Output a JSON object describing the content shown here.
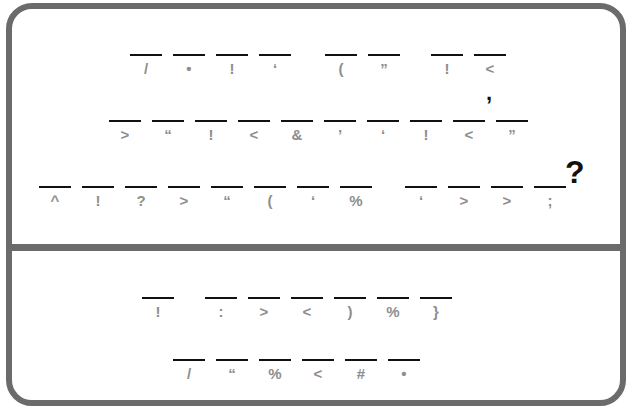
{
  "puzzle": {
    "type": "cryptogram",
    "question_section": {
      "rows": [
        {
          "line_y": 54,
          "slots": [
            {
              "x": 130,
              "symbol": "/"
            },
            {
              "x": 173,
              "symbol": "•"
            },
            {
              "x": 216,
              "symbol": "!"
            },
            {
              "x": 259,
              "symbol": "‘"
            },
            {
              "x": 325,
              "symbol": "("
            },
            {
              "x": 368,
              "symbol": "”"
            },
            {
              "x": 431,
              "symbol": "!"
            },
            {
              "x": 474,
              "symbol": "<"
            }
          ]
        },
        {
          "line_y": 120,
          "slots": [
            {
              "x": 109,
              "symbol": ">"
            },
            {
              "x": 152,
              "symbol": "“"
            },
            {
              "x": 195,
              "symbol": "!"
            },
            {
              "x": 238,
              "symbol": "<"
            },
            {
              "x": 281,
              "symbol": "&"
            },
            {
              "x": 324,
              "symbol": "’"
            },
            {
              "x": 367,
              "symbol": "‘"
            },
            {
              "x": 410,
              "symbol": "!"
            },
            {
              "x": 453,
              "symbol": "<"
            },
            {
              "x": 496,
              "symbol": "”"
            }
          ],
          "punctuation": [
            {
              "char": ",",
              "x": 486,
              "y": 80
            }
          ]
        },
        {
          "line_y": 186,
          "slots": [
            {
              "x": 39,
              "symbol": "^"
            },
            {
              "x": 82,
              "symbol": "!"
            },
            {
              "x": 125,
              "symbol": "?"
            },
            {
              "x": 168,
              "symbol": ">"
            },
            {
              "x": 211,
              "symbol": "“"
            },
            {
              "x": 254,
              "symbol": "("
            },
            {
              "x": 297,
              "symbol": "‘"
            },
            {
              "x": 340,
              "symbol": "%"
            },
            {
              "x": 405,
              "symbol": "‘"
            },
            {
              "x": 448,
              "symbol": ">"
            },
            {
              "x": 491,
              "symbol": ">"
            },
            {
              "x": 534,
              "symbol": ";"
            }
          ],
          "punctuation": [
            {
              "char": "?",
              "x": 565,
              "y": 156
            }
          ]
        }
      ]
    },
    "answer_section": {
      "rows": [
        {
          "line_y": 297,
          "slots": [
            {
              "x": 142,
              "symbol": "!"
            },
            {
              "x": 205,
              "symbol": ":"
            },
            {
              "x": 248,
              "symbol": ">"
            },
            {
              "x": 291,
              "symbol": "<"
            },
            {
              "x": 334,
              "symbol": ")"
            },
            {
              "x": 377,
              "symbol": "%"
            },
            {
              "x": 420,
              "symbol": "}"
            }
          ]
        },
        {
          "line_y": 359,
          "slots": [
            {
              "x": 173,
              "symbol": "/"
            },
            {
              "x": 216,
              "symbol": "“"
            },
            {
              "x": 259,
              "symbol": "%"
            },
            {
              "x": 302,
              "symbol": "<"
            },
            {
              "x": 345,
              "symbol": "#"
            },
            {
              "x": 388,
              "symbol": "•"
            }
          ]
        }
      ]
    },
    "colors": {
      "frame": "#6b6b6b",
      "blank_line": "#111111",
      "cipher_symbol": "#8e8e8e",
      "punctuation": "#111111"
    }
  }
}
